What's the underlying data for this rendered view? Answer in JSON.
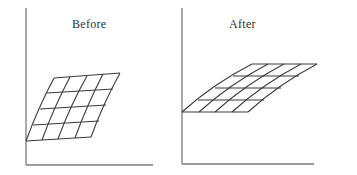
{
  "figure": {
    "panels": [
      {
        "title": "Before",
        "description": "4x4 grid sheared upward-right, left edge anchored at y-axis bottom",
        "grid": {
          "rows": 4,
          "cols": 4
        }
      },
      {
        "title": "After",
        "description": "4x4 grid sheared more strongly to the right, flattened vertically, anchored at y-axis midpoint",
        "grid": {
          "rows": 4,
          "cols": 4
        }
      }
    ],
    "colors": {
      "axis": "#7a7a7a",
      "grid_lines": "#3a3a3a",
      "text": "#333333",
      "background": "#ffffff"
    }
  }
}
